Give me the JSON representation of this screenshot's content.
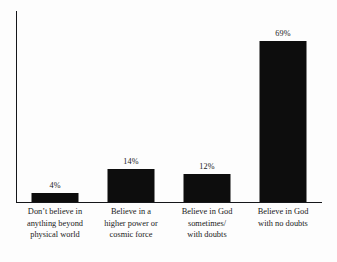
{
  "chart_data": {
    "type": "bar",
    "title": "",
    "subtitle": "",
    "xlabel": "",
    "ylabel": "",
    "ylim": [
      0,
      82
    ],
    "grid": false,
    "legend": "none",
    "axis_ticks": "none",
    "orientation": "vertical",
    "categories": [
      "Don’t believe in anything beyond physical world",
      "Believe in a higher power or cosmic force",
      "Believe in God sometimes/ with doubts",
      "Believe in God with no doubts"
    ],
    "category_lines": [
      [
        "Don’t believe in",
        "anything beyond",
        "physical world"
      ],
      [
        "Believe in a",
        "higher power or",
        "cosmic force"
      ],
      [
        "Believe in God",
        "sometimes/",
        "with doubts"
      ],
      [
        "Believe in God",
        "with no doubts"
      ]
    ],
    "values": [
      4,
      14,
      12,
      69
    ],
    "value_labels": [
      "4%",
      "14%",
      "12%",
      "69%"
    ],
    "colors": {
      "bar": "#0d0d0d",
      "axis": "#15161a",
      "text": "#1a1a1a",
      "background": "#fdfdfd"
    }
  }
}
